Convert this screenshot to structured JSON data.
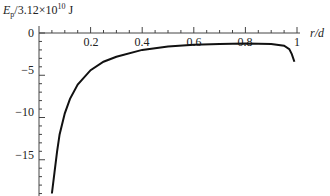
{
  "chart_data": {
    "type": "line",
    "title": "",
    "ylabel": "E_p/3.12×10^10 J",
    "ylabel_main": "E",
    "ylabel_sub": "p",
    "ylabel_rest": "/3.12×10",
    "ylabel_exp": "10",
    "ylabel_unit": " J",
    "xlabel": "r/d",
    "xlim": [
      0,
      1
    ],
    "ylim": [
      -19,
      1
    ],
    "grid": false,
    "x_ticks": [
      0.2,
      0.4,
      0.6,
      0.8,
      1
    ],
    "x_tick_labels": [
      "0.2",
      "0.4",
      "0.6",
      "0.8",
      "1"
    ],
    "y_ticks": [
      0,
      -5,
      -10,
      -15
    ],
    "y_tick_labels": [
      "0",
      "−5",
      "−10",
      "−15"
    ],
    "series": [
      {
        "name": "E_p",
        "x": [
          0.05,
          0.06,
          0.07,
          0.08,
          0.1,
          0.12,
          0.15,
          0.2,
          0.25,
          0.3,
          0.4,
          0.5,
          0.6,
          0.7,
          0.8,
          0.9,
          0.95,
          0.97,
          0.98,
          0.99
        ],
        "values": [
          -19,
          -16.5,
          -14,
          -12,
          -9.5,
          -7.8,
          -6.1,
          -4.4,
          -3.4,
          -2.8,
          -2.0,
          -1.6,
          -1.4,
          -1.3,
          -1.25,
          -1.3,
          -1.5,
          -1.9,
          -2.5,
          -3.4
        ]
      }
    ]
  },
  "labels": {
    "x_axis": "r/d",
    "x_tick_0": "0.2",
    "x_tick_1": "0.4",
    "x_tick_2": "0.6",
    "x_tick_3": "0.8",
    "x_tick_4": "1",
    "y_tick_0": "0",
    "y_tick_1": "−5",
    "y_tick_2": "−10",
    "y_tick_3": "−15"
  }
}
